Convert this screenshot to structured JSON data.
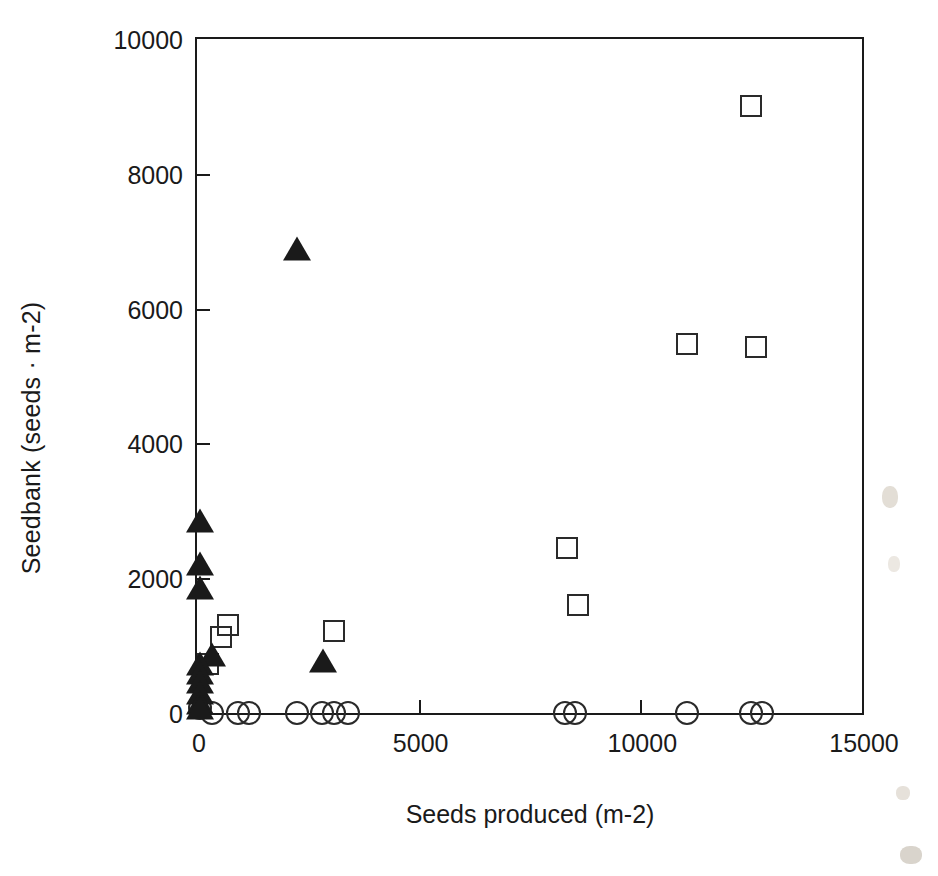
{
  "chart_data": {
    "type": "scatter",
    "title": "",
    "xlabel": "Seeds produced (m-2)",
    "ylabel": "Seedbank (seeds · m-2)",
    "xlim": [
      0,
      15000
    ],
    "ylim": [
      0,
      10000
    ],
    "xticks": [
      0,
      5000,
      10000,
      15000
    ],
    "xtick_labels": [
      "0",
      "5000",
      "10000",
      "15000"
    ],
    "yticks": [
      0,
      2000,
      4000,
      6000,
      8000,
      10000
    ],
    "ytick_labels": [
      "0",
      "2000",
      "4000",
      "6000",
      "8000",
      "10000"
    ],
    "grid": false,
    "legend": "none",
    "series": [
      {
        "name": "open-square",
        "marker": "square-open",
        "color": "#2a2a2a",
        "points": [
          [
            12500,
            9000
          ],
          [
            11050,
            5470
          ],
          [
            12600,
            5430
          ],
          [
            8350,
            2450
          ],
          [
            8600,
            1600
          ],
          [
            700,
            1300
          ],
          [
            550,
            1130
          ],
          [
            3100,
            1220
          ],
          [
            250,
            720
          ]
        ]
      },
      {
        "name": "filled-triangle",
        "marker": "triangle-filled",
        "color": "#1a1a1a",
        "points": [
          [
            2250,
            6850
          ],
          [
            60,
            2820
          ],
          [
            60,
            2180
          ],
          [
            60,
            1830
          ],
          [
            330,
            830
          ],
          [
            2850,
            740
          ],
          [
            60,
            700
          ],
          [
            60,
            560
          ],
          [
            60,
            430
          ],
          [
            60,
            260
          ],
          [
            60,
            120
          ],
          [
            60,
            40
          ]
        ]
      },
      {
        "name": "open-circle",
        "marker": "circle-open",
        "color": "#2a2a2a",
        "points": [
          [
            60,
            70
          ],
          [
            330,
            0
          ],
          [
            930,
            0
          ],
          [
            1170,
            0
          ],
          [
            2250,
            0
          ],
          [
            2820,
            0
          ],
          [
            3100,
            0
          ],
          [
            3400,
            0
          ],
          [
            8300,
            0
          ],
          [
            8520,
            0
          ],
          [
            11050,
            0
          ],
          [
            12500,
            0
          ],
          [
            12750,
            0
          ]
        ]
      }
    ]
  },
  "axes": {
    "x_title": "Seeds produced (m-2)",
    "y_title": "Seedbank (seeds · m-2)"
  },
  "page": {
    "caption_fragment": ""
  },
  "colors": {
    "axis": "#1a1a1a",
    "marker_open": "#2a2a2a",
    "marker_filled": "#1a1a1a",
    "background": "#ffffff"
  }
}
